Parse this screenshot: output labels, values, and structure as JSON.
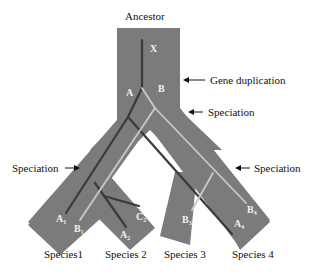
{
  "title": "Ancestor",
  "colors": {
    "tree_body": "#7b7b7b",
    "gene_a_line": "#3a3a3a",
    "gene_b_line": "#c9c9c9",
    "text": "#111111",
    "inner_text": "#f2f2f2"
  },
  "gene_labels": {
    "ancestral": "X",
    "copy_a": "A",
    "copy_b": "B"
  },
  "events": [
    {
      "label": "Gene duplication",
      "side": "right"
    },
    {
      "label": "Speciation",
      "side": "right"
    },
    {
      "label": "Speciation",
      "side": "left"
    },
    {
      "label": "Speciation",
      "side": "right"
    }
  ],
  "tips": [
    {
      "gene": "A",
      "sub": "1"
    },
    {
      "gene": "B",
      "sub": "1"
    },
    {
      "gene": "A",
      "sub": "2"
    },
    {
      "gene": "C",
      "sub": "2"
    },
    {
      "gene": "B",
      "sub": "3"
    },
    {
      "gene": "B",
      "sub": "4"
    },
    {
      "gene": "A",
      "sub": "4"
    }
  ],
  "species": [
    "Species1",
    "Species 2",
    "Species 3",
    "Species 4"
  ]
}
